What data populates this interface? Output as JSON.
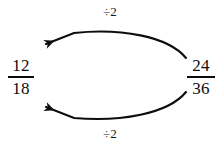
{
  "diagram": {
    "type": "fraction-simplification",
    "background_color": "#ffffff",
    "ink_color": "#0d0d0d",
    "fractions": {
      "left": {
        "numerator": "12",
        "denominator": "18",
        "role": "result"
      },
      "right": {
        "numerator": "24",
        "denominator": "36",
        "role": "source"
      }
    },
    "operations": {
      "top": {
        "label": "÷2",
        "direction": "right-to-left"
      },
      "bottom": {
        "label": "÷2",
        "direction": "right-to-left"
      }
    },
    "arrows": {
      "top": {
        "name": "numerator-divide-arrow",
        "points_to": "12",
        "arrowhead": "filled-barb"
      },
      "bottom": {
        "name": "denominator-divide-arrow",
        "points_to": "18",
        "arrowhead": "filled-barb"
      }
    }
  }
}
